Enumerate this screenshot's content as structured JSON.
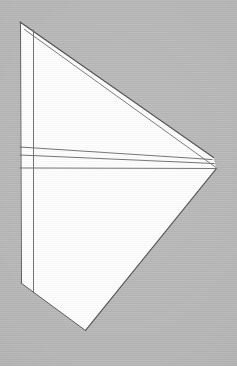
{
  "canvas": {
    "width": 237,
    "height": 366,
    "background_color": "#b7b7b7",
    "texture": "horizontal-scanlines"
  },
  "figure": {
    "paper_fill": "#ffffff",
    "stroke_color": "#4f4f4f",
    "stroke_color_light": "#8a8a8a",
    "stroke_width": 1,
    "vertices": {
      "top_apex": [
        20,
        22
      ],
      "right_tip": [
        216,
        168
      ],
      "right_tip_upper": [
        213,
        157
      ],
      "bottom_vertex": [
        85,
        330
      ],
      "left_top": [
        20,
        22
      ],
      "left_bottom": [
        21,
        283
      ],
      "inner_left_top": [
        33,
        30
      ],
      "inner_left_bottom": [
        33,
        292
      ]
    },
    "outline_points": "20,22 216,168 85,330 21,283",
    "shapes": [
      {
        "name": "main-paper-body",
        "type": "polygon",
        "points": "20,22 216,168 85,330 21,283",
        "fill": "#ffffff",
        "stroke": "#4f4f4f"
      },
      {
        "name": "top-edge-upper-line",
        "type": "line",
        "points": "20,22 213,157",
        "stroke": "#4a4a4a"
      },
      {
        "name": "top-edge-lower-line",
        "type": "line",
        "points": "24,29 216,168",
        "stroke": "#6a6a6a"
      },
      {
        "name": "left-outer-vertical-edge",
        "type": "line",
        "points": "20,22 21,283",
        "stroke": "#5a5a5a"
      },
      {
        "name": "left-inner-vertical-crease",
        "type": "line",
        "points": "33,30 33,292",
        "stroke": "#6e6e6e"
      },
      {
        "name": "bottom-left-diagonal-edge",
        "type": "line",
        "points": "21,283 85,330",
        "stroke": "#5a5a5a"
      },
      {
        "name": "bottom-right-diagonal-edge",
        "type": "line",
        "points": "85,330 216,168",
        "stroke": "#4a4a4a"
      },
      {
        "name": "horizontal-crease-top",
        "type": "line",
        "points": "20,147 213,160",
        "stroke": "#6e6e6e"
      },
      {
        "name": "horizontal-crease-middle",
        "type": "line",
        "points": "20,155 214,164",
        "stroke": "#6e6e6e"
      },
      {
        "name": "horizontal-crease-bottom",
        "type": "line",
        "points": "20,168 216,168",
        "stroke": "#6e6e6e"
      }
    ],
    "crease_count": 3,
    "vertical_crease_count": 2
  }
}
